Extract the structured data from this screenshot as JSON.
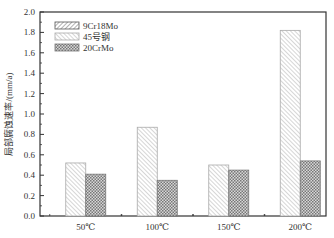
{
  "chart_data": {
    "type": "bar",
    "title": "",
    "xlabel": "",
    "ylabel": "局部腐蚀速率/(mm/a)",
    "ylim": [
      0,
      2.0
    ],
    "yticks": [
      "0.0",
      "0.2",
      "0.4",
      "0.6",
      "0.8",
      "1.0",
      "1.2",
      "1.4",
      "1.6",
      "1.8",
      "2.0"
    ],
    "categories": [
      "50℃",
      "100℃",
      "150℃",
      "200℃"
    ],
    "series": [
      {
        "name": "9Cr18Mo",
        "pattern": "dense-diagonal",
        "values": [
          null,
          null,
          null,
          null
        ]
      },
      {
        "name": "45号钢",
        "pattern": "light-diagonal",
        "values": [
          0.52,
          0.87,
          0.5,
          1.82
        ]
      },
      {
        "name": "20CrMo",
        "pattern": "crosshatch",
        "values": [
          0.41,
          0.35,
          0.45,
          0.54
        ]
      }
    ],
    "legend": {
      "position": "upper-left",
      "entries": [
        "9Cr18Mo",
        "45号钢",
        "20CrMo"
      ]
    },
    "grid": false
  }
}
